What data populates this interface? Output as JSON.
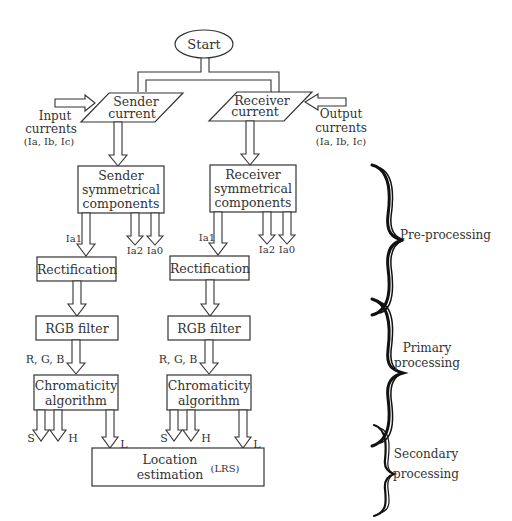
{
  "diagram": {
    "start": "Start",
    "sender_current": [
      "Sender",
      "current"
    ],
    "receiver_current": [
      "Receiver",
      "current"
    ],
    "input_currents": [
      "Input",
      "currents",
      "(Ia, Ib, Ic)"
    ],
    "output_currents": [
      "Output",
      "currents",
      "(Ia, Ib, Ic)"
    ],
    "sender_sym": [
      "Sender",
      "symmetrical",
      "components"
    ],
    "receiver_sym": [
      "Receiver",
      "symmetrical",
      "components"
    ],
    "ia1": "Ia1",
    "ia2": "Ia2",
    "ia0": "Ia0",
    "rectification": "Rectification",
    "rgb_filter": "RGB filter",
    "rgb": "R, G, B",
    "chromaticity": [
      "Chromaticity",
      "algorithm"
    ],
    "s": "S",
    "h": "H",
    "l": "L",
    "location": [
      "Location",
      "estimation"
    ],
    "lrs": "(LRS)",
    "stages": {
      "pre": "Pre-processing",
      "primary": [
        "Primary",
        "processing"
      ],
      "secondary": [
        "Secondary",
        "processing"
      ]
    }
  }
}
